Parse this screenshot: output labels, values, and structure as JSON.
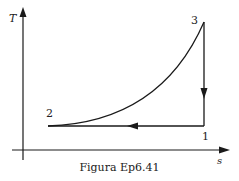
{
  "figure": {
    "caption": "Figura Ep6.41",
    "axes": {
      "y_label": "T",
      "x_label": "s"
    },
    "points": [
      {
        "label": "1"
      },
      {
        "label": "2"
      },
      {
        "label": "3"
      }
    ],
    "processes": [
      {
        "from": "1",
        "to": "2",
        "type": "horizontal (isothermal)",
        "direction": "left"
      },
      {
        "from": "2",
        "to": "3",
        "type": "curve (increasing)"
      },
      {
        "from": "3",
        "to": "1",
        "type": "vertical (isentropic)",
        "direction": "down"
      }
    ],
    "line_color": "#1a1a1a"
  }
}
